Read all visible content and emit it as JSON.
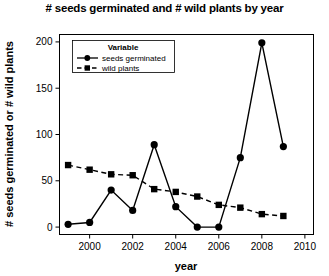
{
  "chart_data": {
    "type": "line",
    "title": "# seeds germinated and # wild plants by year",
    "xlabel": "year",
    "ylabel": "# seeds germinated or # wild plants",
    "x": [
      1999,
      2000,
      2001,
      2002,
      2003,
      2004,
      2005,
      2006,
      2007,
      2008,
      2009
    ],
    "series": [
      {
        "name": "seeds germinated",
        "values": [
          3,
          5,
          40,
          18,
          89,
          22,
          0,
          0,
          75,
          199,
          87
        ],
        "marker": "circle",
        "line": "solid",
        "color": "#000000"
      },
      {
        "name": "wild plants",
        "values": [
          67,
          62,
          57,
          56,
          41,
          38,
          33,
          24,
          21,
          14,
          12
        ],
        "marker": "square",
        "line": "dashed",
        "color": "#000000"
      }
    ],
    "xlim": [
      1998.6,
      2010.4
    ],
    "ylim": [
      -8,
      208
    ],
    "xticks": [
      2000,
      2002,
      2004,
      2006,
      2008,
      2010
    ],
    "xtick_labels": [
      "2000",
      "2002",
      "2004",
      "2006",
      "2008",
      "2010"
    ],
    "yticks": [
      0,
      50,
      100,
      150,
      200
    ],
    "ytick_labels": [
      "0",
      "50",
      "100",
      "150",
      "200"
    ],
    "grid": false,
    "legend_position": "upper-left",
    "legend_title": "Variable"
  }
}
